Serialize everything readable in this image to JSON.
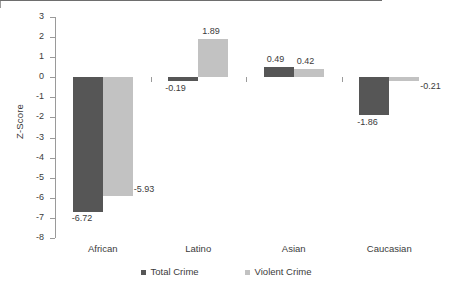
{
  "chart_data": {
    "type": "bar",
    "title": "",
    "xlabel": "",
    "ylabel": "Z-Score",
    "ylim": [
      -8,
      3
    ],
    "yticks": [
      3,
      2,
      1,
      0,
      -1,
      -2,
      -3,
      -4,
      -5,
      -6,
      -7,
      -8
    ],
    "ytick_labels": [
      "3",
      "2",
      "1",
      "0",
      "-1",
      "-2",
      "-3",
      "-4",
      "-5",
      "-6",
      "-7",
      "-8"
    ],
    "grid": false,
    "legend_position": "bottom",
    "categories": [
      "African",
      "Latino",
      "Asian",
      "Caucasian"
    ],
    "series": [
      {
        "name": "Total Crime",
        "color": "#565656",
        "values": [
          -6.72,
          -0.19,
          0.49,
          -1.86
        ],
        "labels": [
          "-6.72",
          "-0.19",
          "0.49",
          "-1.86"
        ]
      },
      {
        "name": "Violent Crime",
        "color": "#c2c2c2",
        "values": [
          -5.93,
          1.89,
          0.42,
          -0.21
        ],
        "labels": [
          "-5.93",
          "1.89",
          "0.42",
          "-0.21"
        ]
      }
    ]
  }
}
